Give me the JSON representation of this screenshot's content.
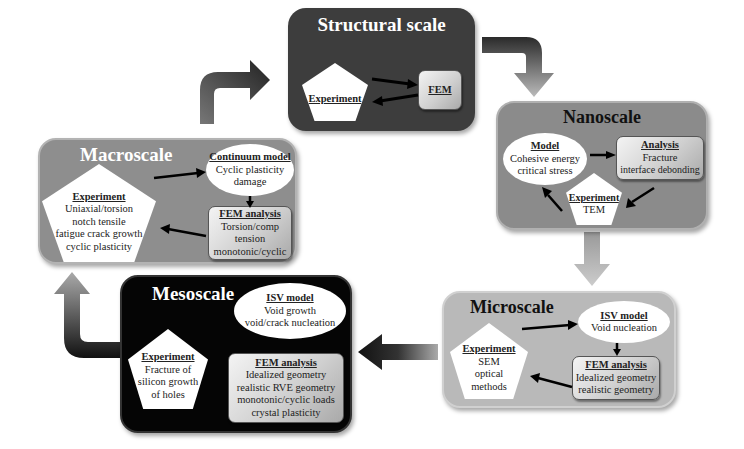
{
  "diagram": {
    "panels": {
      "structural": {
        "title": "Structural scale",
        "experiment": {
          "heading": "Experiment"
        },
        "fem": {
          "heading": "FEM"
        }
      },
      "nanoscale": {
        "title": "Nanoscale",
        "model": {
          "heading": "Model",
          "lines": [
            "Cohesive energy",
            "critical stress"
          ]
        },
        "analysis": {
          "heading": "Analysis",
          "lines": [
            "Fracture",
            "interface debonding"
          ]
        },
        "experiment": {
          "heading": "Experiment",
          "lines": [
            "TEM"
          ]
        }
      },
      "macroscale": {
        "title": "Macroscale",
        "continuum": {
          "heading": "Continuum model",
          "lines": [
            "Cyclic plasticity",
            "damage"
          ]
        },
        "experiment": {
          "heading": "Experiment",
          "lines": [
            "Uniaxial/torsion",
            "notch tensile",
            "fatigue crack growth",
            "cyclic plasticity"
          ]
        },
        "fem": {
          "heading": "FEM analysis",
          "lines": [
            "Torsion/comp",
            "tension",
            "monotonic/cyclic"
          ]
        }
      },
      "mesoscale": {
        "title": "Mesoscale",
        "isv": {
          "heading": "ISV model",
          "lines": [
            "Void growth",
            "void/crack nucleation"
          ]
        },
        "experiment": {
          "heading": "Experiment",
          "lines": [
            "Fracture of",
            "silicon growth",
            "of holes"
          ]
        },
        "fem": {
          "heading": "FEM analysis",
          "lines": [
            "Idealized geometry",
            "realistic RVE geometry",
            "monotonic/cyclic loads",
            "crystal plasticity"
          ]
        }
      },
      "microscale": {
        "title": "Microscale",
        "isv": {
          "heading": "ISV model",
          "lines": [
            "Void nucleation"
          ]
        },
        "experiment": {
          "heading": "Experiment",
          "lines": [
            "SEM",
            "optical",
            "methods"
          ]
        },
        "fem": {
          "heading": "FEM analysis",
          "lines": [
            "Idealized geometry",
            "realistic geometry"
          ]
        }
      }
    },
    "colors": {
      "structural_bg": "#3d3d3d",
      "nanoscale_bg": "#8b8b8b",
      "macroscale_bg": "#8e8e8e",
      "mesoscale_bg": "#050505",
      "microscale_bg": "#b9b9b9"
    }
  }
}
